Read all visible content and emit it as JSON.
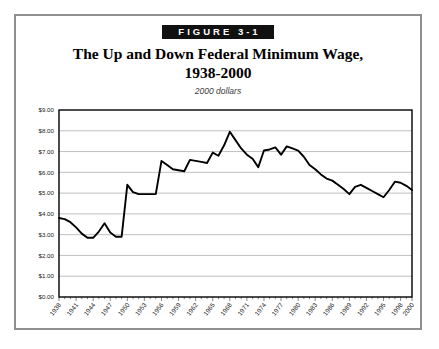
{
  "figure": {
    "badge": "FIGURE 3-1",
    "title_line1": "The Up and Down Federal Minimum Wage,",
    "title_line2": "1938-2000",
    "subtitle": "2000 dollars"
  },
  "colors": {
    "badge_background": "#111111",
    "badge_text": "#ffffff",
    "line": "#000000",
    "gridline": "#b9b9b9",
    "frame": "#000000",
    "outer_border": "#8f8f8f",
    "page_background": "#ffffff"
  },
  "chart_data": {
    "type": "line",
    "title": "The Up and Down Federal Minimum Wage, 1938-2000",
    "subtitle": "2000 dollars",
    "xlabel": "",
    "ylabel": "",
    "xlim": [
      1938,
      2000
    ],
    "ylim": [
      0,
      9
    ],
    "grid": true,
    "legend": null,
    "ytick_labels": [
      "$0.00",
      "$1.00",
      "$2.00",
      "$3.00",
      "$4.00",
      "$5.00",
      "$6.00",
      "$7.00",
      "$8.00",
      "$9.00"
    ],
    "ytick_values": [
      0,
      1,
      2,
      3,
      4,
      5,
      6,
      7,
      8,
      9
    ],
    "xtick_labels": [
      "1938",
      "1941",
      "1944",
      "1947",
      "1950",
      "1953",
      "1956",
      "1959",
      "1962",
      "1965",
      "1968",
      "1971",
      "1974",
      "1977",
      "1980",
      "1983",
      "1986",
      "1989",
      "1992",
      "1995",
      "1998",
      "2000"
    ],
    "xtick_values": [
      1938,
      1941,
      1944,
      1947,
      1950,
      1953,
      1956,
      1959,
      1962,
      1965,
      1968,
      1971,
      1974,
      1977,
      1980,
      1983,
      1986,
      1989,
      1992,
      1995,
      1998,
      2000
    ],
    "series": [
      {
        "name": "Federal minimum wage (2000 dollars)",
        "x": [
          1938,
          1939,
          1940,
          1941,
          1942,
          1943,
          1944,
          1945,
          1946,
          1947,
          1948,
          1949,
          1950,
          1951,
          1952,
          1953,
          1954,
          1955,
          1956,
          1957,
          1958,
          1959,
          1960,
          1961,
          1962,
          1963,
          1964,
          1965,
          1966,
          1967,
          1968,
          1969,
          1970,
          1971,
          1972,
          1973,
          1974,
          1975,
          1976,
          1977,
          1978,
          1979,
          1980,
          1981,
          1982,
          1983,
          1984,
          1985,
          1986,
          1987,
          1988,
          1989,
          1990,
          1991,
          1992,
          1993,
          1994,
          1995,
          1996,
          1997,
          1998,
          1999,
          2000
        ],
        "y": [
          3.8,
          3.75,
          3.6,
          3.35,
          3.05,
          2.85,
          2.85,
          3.15,
          3.55,
          3.1,
          2.9,
          2.9,
          5.4,
          5.05,
          4.95,
          4.95,
          4.95,
          4.95,
          6.55,
          6.35,
          6.15,
          6.1,
          6.05,
          6.6,
          6.55,
          6.5,
          6.45,
          6.95,
          6.8,
          7.3,
          7.95,
          7.55,
          7.15,
          6.85,
          6.65,
          6.25,
          7.05,
          7.1,
          7.2,
          6.85,
          7.25,
          7.15,
          7.05,
          6.75,
          6.35,
          6.15,
          5.9,
          5.7,
          5.6,
          5.4,
          5.2,
          4.95,
          5.3,
          5.4,
          5.25,
          5.1,
          4.95,
          4.8,
          5.15,
          5.55,
          5.5,
          5.35,
          5.15
        ]
      }
    ]
  }
}
